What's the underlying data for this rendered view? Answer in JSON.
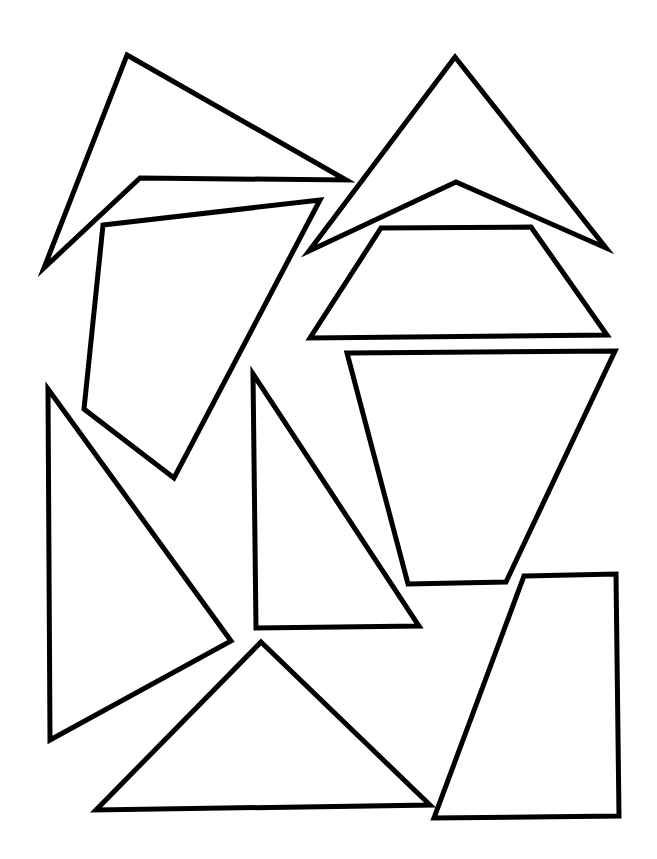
{
  "page": {
    "width": 657,
    "height": 859,
    "background": "#ffffff",
    "stroke_color": "#000000",
    "stroke_width": 5
  },
  "shapes": [
    {
      "name": "top-left-concave-quadrilateral",
      "points": "127,55 346,180 140,178 44,268"
    },
    {
      "name": "top-right-arrowhead",
      "points": "455,57 606,248 456,182 309,251"
    },
    {
      "name": "upper-left-quadrilateral",
      "points": "103,225 320,200 174,478 84,409"
    },
    {
      "name": "upper-right-trapezoid",
      "points": "381,228 531,227 607,335 310,338"
    },
    {
      "name": "middle-right-inverted-trapezoid",
      "points": "347,353 615,351 506,582 408,584"
    },
    {
      "name": "left-tall-triangle",
      "points": "48,389 231,641 50,740"
    },
    {
      "name": "middle-right-triangle",
      "points": "253,374 419,626 256,628"
    },
    {
      "name": "bottom-triangle",
      "points": "261,642 430,805 96,810"
    },
    {
      "name": "bottom-right-quadrilateral",
      "points": "524,576 616,574 619,816 434,818"
    }
  ]
}
